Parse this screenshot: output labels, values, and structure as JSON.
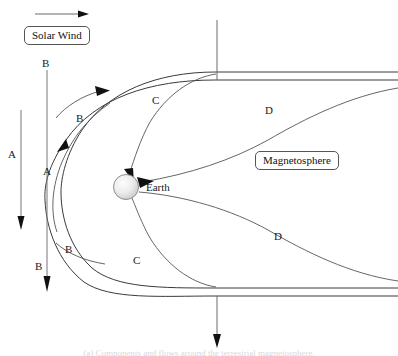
{
  "figure": {
    "background_color": "#ffffff",
    "line_color": "#3a3a3a",
    "earth_color": "#e8e8e8"
  },
  "boxed_labels": {
    "solar_wind": "Solar Wind",
    "magnetosphere": "Magnetosphere"
  },
  "body_labels": {
    "earth": "Earth"
  },
  "curve_labels": {
    "a_left": "A",
    "a_inner": "A",
    "b_top_line": "B",
    "b_top_curve": "B",
    "b_bottom_curve": "B",
    "b_bottom_line": "B",
    "c_upper": "C",
    "c_lower": "C",
    "d_upper": "D",
    "d_lower": "D"
  },
  "caption": {
    "text": "(a) Components and flows around the terrestrial magnetosphere."
  }
}
